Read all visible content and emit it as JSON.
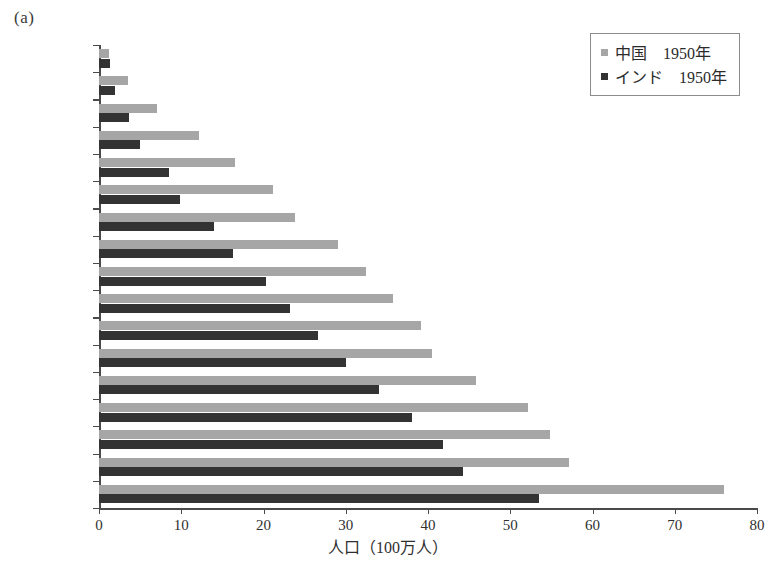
{
  "figure": {
    "panel_label": "(a)"
  },
  "legend": {
    "position": "top-right",
    "entries": [
      {
        "label": "中国　1950年",
        "color": "#a6a6a6",
        "swatch_name": "legend-swatch-china"
      },
      {
        "label": "インド　1950年",
        "color": "#333333",
        "swatch_name": "legend-swatch-india"
      }
    ]
  },
  "chart_data": {
    "type": "bar",
    "orientation": "horizontal",
    "title": "",
    "subtitle": "",
    "xlabel": "人口（100万人）",
    "ylabel": "",
    "xlim": [
      0,
      80
    ],
    "ylim": null,
    "grid": false,
    "legend_position": "top-right",
    "xticks": [
      0,
      10,
      20,
      30,
      40,
      50,
      60,
      70,
      80
    ],
    "xtick_labels": [
      "0",
      "10",
      "20",
      "30",
      "40",
      "50",
      "60",
      "70",
      "80"
    ],
    "categories": [
      "80＋",
      "75－79",
      "70－74",
      "65－69",
      "60－64",
      "55－59",
      "50－54",
      "45－49",
      "40－44",
      "35－39",
      "30－34",
      "25－29",
      "20－24",
      "15－19",
      "10－14",
      "5－9",
      "0－4"
    ],
    "series": [
      {
        "name": "中国　1950年",
        "color": "#a6a6a6",
        "values": [
          1.2,
          3.5,
          7.0,
          12.2,
          16.5,
          21.2,
          23.8,
          29.0,
          32.5,
          35.8,
          39.2,
          40.5,
          45.8,
          52.2,
          54.8,
          57.2,
          76.0
        ]
      },
      {
        "name": "インド　1950年",
        "color": "#333333",
        "values": [
          1.3,
          1.9,
          3.6,
          5.0,
          8.5,
          9.8,
          14.0,
          16.3,
          20.3,
          23.2,
          26.6,
          30.0,
          34.0,
          38.0,
          41.8,
          44.2,
          53.5
        ]
      }
    ]
  }
}
